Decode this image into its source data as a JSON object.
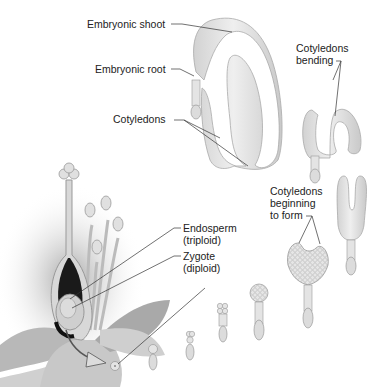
{
  "diagram": {
    "labels": {
      "embryonic_shoot": "Embryonic shoot",
      "embryonic_root": "Embryonic root",
      "cotyledons": "Cotyledons",
      "cotyledons_bending_1": "Cotyledons",
      "cotyledons_bending_2": "bending",
      "cotyledons_forming_1": "Cotyledons",
      "cotyledons_forming_2": "beginning",
      "cotyledons_forming_3": "to form",
      "endosperm_1": "Endosperm",
      "endosperm_2": "(triploid)",
      "zygote_1": "Zygote",
      "zygote_2": "(diploid)"
    },
    "stages": [
      "zygote",
      "two-cell",
      "four-cell",
      "proembryo",
      "globular",
      "heart",
      "torpedo",
      "bending",
      "mature"
    ],
    "colors": {
      "embryo_fill": "#e4e4e4",
      "embryo_shade": "#c4c4c4",
      "line": "#333333",
      "flower": "#bdbdbd",
      "ovule_dark": "#1a1a1a"
    }
  }
}
